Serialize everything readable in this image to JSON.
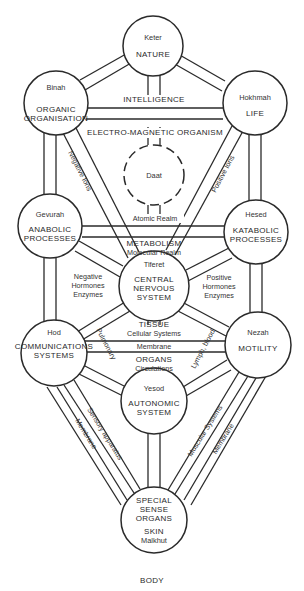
{
  "diagram": {
    "footer": "BODY",
    "nodes": {
      "keter": {
        "name": "Keter",
        "title": [
          "NATURE"
        ]
      },
      "binah": {
        "name": "Binah",
        "title": [
          "ORGANIC",
          "ORGANISATION"
        ]
      },
      "hokhmah": {
        "name": "Hokhmah",
        "title": [
          "LIFE"
        ]
      },
      "daat": {
        "name": "Daat",
        "title": []
      },
      "gevurah": {
        "name": "Gevurah",
        "title": [
          "ANABOLIC",
          "PROCESSES"
        ]
      },
      "hesed": {
        "name": "Hesed",
        "title": [
          "KATABOLIC",
          "PROCESSES"
        ]
      },
      "tiferet": {
        "name": "Tiferet",
        "title": [
          "CENTRAL",
          "NERVOUS",
          "SYSTEM"
        ]
      },
      "hod": {
        "name": "Hod",
        "title": [
          "COMMUNICATIONS",
          "SYSTEMS"
        ]
      },
      "nezah": {
        "name": "Nezah",
        "title": [
          "MOTILITY"
        ]
      },
      "yesod": {
        "name": "Yesod",
        "title": [
          "AUTONOMIC",
          "SYSTEM"
        ]
      },
      "malkhut": {
        "name": "Malkhut",
        "title": [
          "SPECIAL",
          "SENSE",
          "ORGANS",
          "SKIN"
        ]
      }
    },
    "path_labels": {
      "intelligence": "INTELLIGENCE",
      "electro_magnetic": "ELECTRO-MAGNETIC ORGANISM",
      "negative_ions": "Negative Ions",
      "positive_ions": "Positive Ions",
      "atomic_realm": "Atomic Realm",
      "metabolism": "METABOLISM",
      "molecular_realm": "Molecular Realm",
      "negative_hormones": [
        "Negative",
        "Hormones",
        "Enzymes"
      ],
      "positive_hormones": [
        "Positive",
        "Hormones",
        "Enzymes"
      ],
      "tissue": "TISSUE",
      "cellular_systems": "Cellular Systems",
      "membrane_mid": "Membrane",
      "organs": "ORGANS",
      "circulations": "Circulations",
      "pulmonary": "Pulmonary",
      "lymph_blood": "Lymph, blood",
      "sensory_apparatus": "Sensory apparatus",
      "membrane_left": "Membrane",
      "muscular_systems": "Muscular Systems",
      "membrane_right": "Membrane"
    }
  }
}
